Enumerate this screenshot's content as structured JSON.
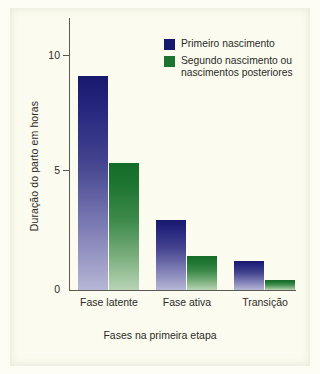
{
  "chart_data": {
    "type": "bar",
    "title": "",
    "subtitle": "",
    "xlabel": "Fases na primeira etapa",
    "ylabel": "Duração do parto em horas",
    "categories": [
      "Fase latente",
      "Fase ativa",
      "Transição"
    ],
    "series": [
      {
        "name": "Primeiro nascimento",
        "color": "#18186d",
        "values": [
          8.9,
          2.9,
          1.2
        ]
      },
      {
        "name": "Segundo nascimento ou nascimentos posteriores",
        "color": "#156b28",
        "values": [
          5.3,
          1.4,
          0.4
        ]
      }
    ],
    "ylim": [
      0,
      11.5
    ],
    "yticks": [
      0,
      5,
      10
    ],
    "ytick_labels": [
      "0",
      "5",
      "10"
    ],
    "grid": false,
    "legend_position": "top-right",
    "annotations": []
  },
  "legend": {
    "entries": [
      {
        "label": "Primeiro nascimento",
        "color": "#18186d"
      },
      {
        "label_line1": "Segundo nascimento ou",
        "label_line2": "nascimentos posteriores",
        "color": "#156b28"
      }
    ]
  },
  "axes": {
    "y_title": "Duração do parto em horas",
    "x_title": "Fases na primeira etapa",
    "y_tick_10": "10",
    "y_tick_5": "5",
    "y_tick_0": "0",
    "x_cat_0": "Fase latente",
    "x_cat_1": "Fase ativa",
    "x_cat_2": "Transição"
  },
  "colors": {
    "background": "#fbfbef",
    "axis": "#5a5a52",
    "text": "#2b2b28",
    "series_blue_top": "#18186d",
    "series_blue_bottom": "#b6b6d6",
    "series_green_top": "#156b28",
    "series_green_bottom": "#b9d4b6"
  }
}
